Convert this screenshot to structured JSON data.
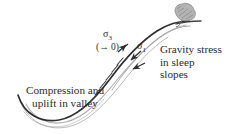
{
  "figure": {
    "type": "hand-drawn geological cross-section diagram",
    "background_color": "#ffffff",
    "ink_color": "#2b2b2b",
    "light_ink_color": "#9a9a9a",
    "rock_color": "#a8a8a8"
  },
  "annotations": {
    "left": {
      "line1": "Compression and",
      "line2": "uplift in valley"
    },
    "right": {
      "line1": "Gravity stress",
      "line2": "in sleep",
      "line3": "slopes"
    }
  },
  "stress_labels": {
    "sigma3": {
      "symbol": "σ",
      "subscript": "3"
    },
    "sigma3_tends": "(→ 0)",
    "sigma1": {
      "symbol": "σ",
      "subscript": "1"
    }
  },
  "elements": {
    "ground_surface": "main dark curve rising from valley floor to slope crest",
    "subsurface_curves": "light grey curves parallel below ground surface",
    "boulder": "grey scribbled rock mass at slope crest",
    "shear_ticks": "short dashed tick marks along slope",
    "arrows": "arrows indicating stress directions into and along slope"
  }
}
